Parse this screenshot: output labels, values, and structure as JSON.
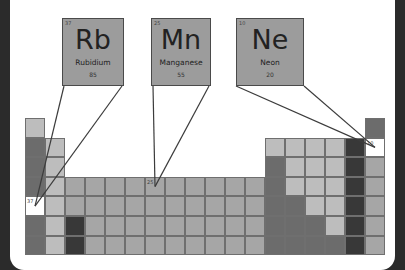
{
  "colors": {
    "background": "#2b2b2b",
    "panel": "#ffffff",
    "highlight": "#ffffff",
    "callout_fill": "#9c9c9c",
    "line": "#3c3c3c",
    "shades": {
      "L": "#bdbdbd",
      "M": "#a6a6a6",
      "D": "#8a8a8a",
      "X": "#6c6c6c",
      "K": "#383838",
      "W": "#ffffff"
    }
  },
  "callouts": [
    {
      "number": "37",
      "symbol": "Rb",
      "name": "Rubidium",
      "mass": "85",
      "col": 1,
      "row": 5
    },
    {
      "number": "25",
      "symbol": "Mn",
      "name": "Manganese",
      "mass": "55",
      "col": 7,
      "row": 4
    },
    {
      "number": "10",
      "symbol": "Ne",
      "name": "Neon",
      "mass": "20",
      "col": 18,
      "row": 2
    }
  ],
  "grid": {
    "columns": 18,
    "rows": 7,
    "layout": [
      "L................X",
      "XL..........LLLLKW",
      "XL..........XLLLKM",
      "XLMMMMMMMMMMXLLLKM",
      "WLMMMMMMMMMMXXLLKM",
      "XLKMMMMMMMMMXXXLKM",
      "XLKMMMMMMMMMXXXXKM"
    ],
    "highlight_labels": [
      {
        "row": 5,
        "col": 1,
        "label": "37"
      },
      {
        "row": 4,
        "col": 7,
        "label": "25"
      },
      {
        "row": 2,
        "col": 18,
        "label": "10"
      }
    ]
  }
}
